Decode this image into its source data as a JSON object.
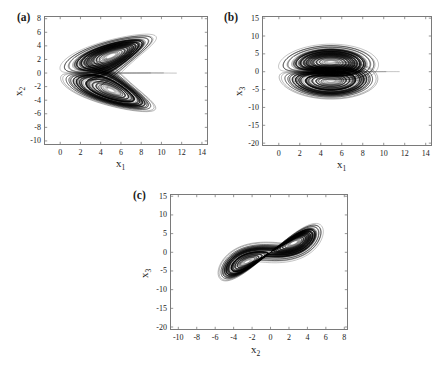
{
  "figure": {
    "panels": [
      {
        "id": "a",
        "label": "(a)",
        "xlabel": "x",
        "xsub": "1",
        "ylabel": "x",
        "ysub": "2",
        "xticks": [
          "0",
          "2",
          "4",
          "6",
          "8",
          "10",
          "12",
          "14"
        ],
        "yticks": [
          "8",
          "6",
          "4",
          "2",
          "0",
          "-2",
          "-4",
          "-6",
          "-8",
          "-10"
        ],
        "xlim": [
          -1.6,
          14.6
        ],
        "ylim": [
          -10.6,
          8.4
        ]
      },
      {
        "id": "b",
        "label": "(b)",
        "xlabel": "x",
        "xsub": "1",
        "ylabel": "x",
        "ysub": "3",
        "xticks": [
          "0",
          "2",
          "4",
          "6",
          "8",
          "10",
          "12",
          "14"
        ],
        "yticks": [
          "15",
          "10",
          "5",
          "0",
          "-5",
          "-10",
          "-15",
          "-20"
        ],
        "xlim": [
          -1.6,
          14.6
        ],
        "ylim": [
          -20.8,
          15.6
        ]
      },
      {
        "id": "c",
        "label": "(c)",
        "xlabel": "x",
        "xsub": "2",
        "ylabel": "x",
        "ysub": "3",
        "xticks": [
          "-10",
          "-8",
          "-6",
          "-4",
          "-2",
          "0",
          "2",
          "4",
          "6",
          "8"
        ],
        "yticks": [
          "15",
          "10",
          "5",
          "0",
          "-5",
          "-10",
          "-15",
          "-20"
        ],
        "xlim": [
          -10.9,
          8.4
        ],
        "ylim": [
          -20.8,
          15.6
        ]
      }
    ]
  },
  "chart_data": {
    "type": "line",
    "title": "",
    "charts": [
      {
        "panel": "a",
        "type": "line",
        "xlabel": "x1",
        "ylabel": "x2",
        "xlim": [
          -1.6,
          14.6
        ],
        "ylim": [
          -10.6,
          8.4
        ],
        "xticks": [
          0,
          2,
          4,
          6,
          8,
          10,
          12,
          14
        ],
        "yticks": [
          -10,
          -8,
          -6,
          -4,
          -2,
          0,
          2,
          4,
          6,
          8
        ],
        "grid": false,
        "legend": null,
        "series_count": 1,
        "notes": "Double-scroll attractor: two symmetric lobes about x2=0 with white voids near (1.8, 2.2) and (1.8, -2.2); dense core spans x1 in 0..6, x2 in -5..5; outer transient loops reach x1 ~ 12.5 and x2 from -9.5 to 7.6"
      },
      {
        "panel": "b",
        "type": "line",
        "xlabel": "x1",
        "ylabel": "x3",
        "xlim": [
          -1.6,
          14.6
        ],
        "ylim": [
          -20.8,
          15.6
        ],
        "xticks": [
          0,
          2,
          4,
          6,
          8,
          10,
          12,
          14
        ],
        "yticks": [
          -20,
          -15,
          -10,
          -5,
          0,
          5,
          10,
          15
        ],
        "grid": false,
        "legend": null,
        "series_count": 1,
        "notes": "Arrowhead / butterfly shape pinched at origin (0,0); upper wing rises to x3 ~ 14.8 near x1 ~ 9, lower wing dips to x3 ~ -19 near x1 ~ 12.4; dense black wedge for x1 in 0..4"
      },
      {
        "panel": "c",
        "type": "line",
        "xlabel": "x2",
        "ylabel": "x3",
        "xlim": [
          -10.9,
          8.4
        ],
        "ylim": [
          -20.8,
          15.6
        ],
        "xticks": [
          -10,
          -8,
          -6,
          -4,
          -2,
          0,
          2,
          4,
          6,
          8
        ],
        "yticks": [
          -20,
          -15,
          -10,
          -5,
          0,
          5,
          10,
          15
        ],
        "grid": false,
        "legend": null,
        "series_count": 1,
        "notes": "Tilted S-shaped spiral band oriented along the line x3 ~ 1.9*x2; dense core centered near (0, 0) spanning x2 in -4..3; outer transient loops reach (7.8, 5) upper right and (-3, -19) lower left"
      }
    ]
  }
}
